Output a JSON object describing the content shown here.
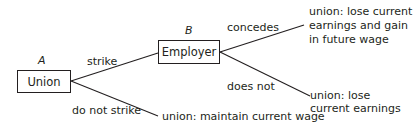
{
  "diagram": {
    "type": "game-tree",
    "nodes": {
      "union": {
        "label": "Union",
        "player": "A"
      },
      "employer": {
        "label": "Employer",
        "player": "B"
      }
    },
    "edges": {
      "strike": "strike",
      "do_not_strike": "do not strike",
      "concedes": "concedes",
      "does_not": "does not"
    },
    "outcomes": {
      "concedes_line1": "union: lose current",
      "concedes_line2": "earnings and gain",
      "concedes_line3": "in future wage",
      "does_not_line1": "union: lose",
      "does_not_line2": "current earnings",
      "no_strike": "union: maintain current wage"
    },
    "colors": {
      "stroke": "#231f20",
      "text": "#231f20"
    }
  }
}
